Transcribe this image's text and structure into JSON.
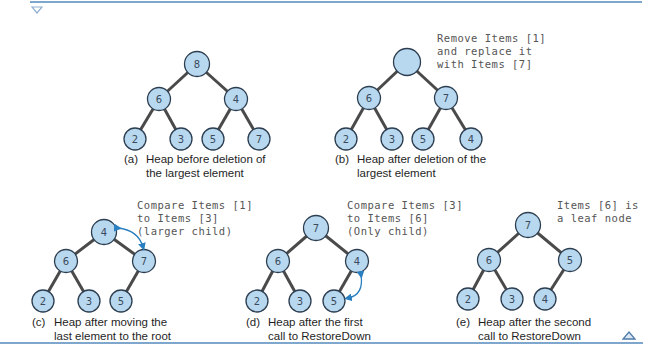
{
  "colors": {
    "node_fill": "#b8d8f0",
    "node_stroke": "#2c3e50",
    "edge": "#4a4a4a",
    "arrow": "#2a7fc0",
    "rule": "#7fa6cc"
  },
  "markers": {
    "top": "down-triangle",
    "bottom": "up-triangle"
  },
  "panels": [
    {
      "id": "a",
      "caption_label": "(a)",
      "caption_line1": "Heap before deletion of",
      "caption_line2": "the largest element",
      "note": "",
      "nodes": [
        "8",
        "6",
        "4",
        "2",
        "3",
        "5",
        "7"
      ]
    },
    {
      "id": "b",
      "caption_label": "(b)",
      "caption_line1": "Heap after deletion of the",
      "caption_line2": "largest element",
      "note_line1": "Remove Items [1]",
      "note_line2": "and replace it",
      "note_line3": "with Items [7]",
      "nodes": [
        "",
        "6",
        "7",
        "2",
        "3",
        "5",
        "4"
      ]
    },
    {
      "id": "c",
      "caption_label": "(c)",
      "caption_line1": "Heap after moving the",
      "caption_line2": "last element to the root",
      "note_line1": "Compare Items [1]",
      "note_line2": "to Items [3]",
      "note_line3": "(larger child)",
      "nodes": [
        "4",
        "6",
        "7",
        "2",
        "3",
        "5"
      ]
    },
    {
      "id": "d",
      "caption_label": "(d)",
      "caption_line1": "Heap after the first",
      "caption_line2": "call to RestoreDown",
      "note_line1": "Compare Items [3]",
      "note_line2": "to Items [6]",
      "note_line3": "(Only child)",
      "nodes": [
        "7",
        "6",
        "4",
        "2",
        "3",
        "5"
      ]
    },
    {
      "id": "e",
      "caption_label": "(e)",
      "caption_line1": "Heap after the second",
      "caption_line2": "call to RestoreDown",
      "note_line1": "Items [6] is",
      "note_line2": "a leaf node",
      "nodes": [
        "7",
        "6",
        "5",
        "2",
        "3",
        "4"
      ]
    }
  ]
}
